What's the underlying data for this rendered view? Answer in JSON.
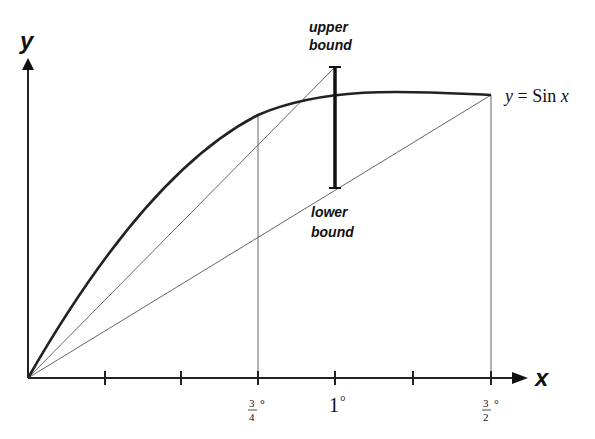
{
  "diagram": {
    "axes": {
      "x_label": "x",
      "y_label": "y"
    },
    "curve_label": {
      "lhs": "y",
      "eq": " = ",
      "fn": "Sin ",
      "var": "x"
    },
    "annotations": {
      "upper_line1": "upper",
      "upper_line2": "bound",
      "lower_line1": "lower",
      "lower_line2": "bound"
    },
    "ticks": {
      "t34_num": "3",
      "t34_den": "4",
      "t1": "1",
      "t32_num": "3",
      "t32_den": "2",
      "degree": "°"
    },
    "colors": {
      "ink": "#111111",
      "thin": "#555555"
    }
  }
}
